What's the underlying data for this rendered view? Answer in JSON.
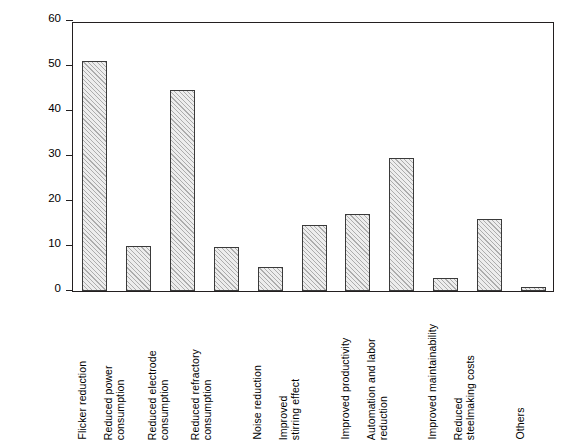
{
  "chart_data": {
    "type": "bar",
    "title": "",
    "subtitle": "",
    "xlabel": "",
    "ylabel": "Evaluation",
    "ylim": [
      0,
      60
    ],
    "yticks": [
      0,
      10,
      20,
      30,
      40,
      50,
      60
    ],
    "ytick_labels": [
      "0",
      "10",
      "20",
      "30",
      "40",
      "50",
      "60"
    ],
    "grid": false,
    "legend": null,
    "legend_position": "none",
    "bar_fill_color": "#ededed",
    "bar_edge_color": "#3a3a3a",
    "bar_hatch": "diagonal-lines",
    "frame_color": "#231f20",
    "categories": [
      "Flicker reduction",
      "Reduced power consumption",
      "Reduced electrode consumption",
      "Reduced refractory consumption",
      "Noise reduction",
      "Improved stirring effect",
      "Improved productivity",
      "Automation and labor reduction",
      "Improved maintainability",
      "Reduced steelmaking costs",
      "Others"
    ],
    "category_lines": [
      [
        "Flicker reduction"
      ],
      [
        "Reduced power",
        "consumption"
      ],
      [
        "Reduced electrode",
        "consumption"
      ],
      [
        "Reduced refractory",
        "consumption"
      ],
      [
        "Noise reduction"
      ],
      [
        "Improved",
        "stirring effect"
      ],
      [
        "Improved productivity"
      ],
      [
        "Automation and labor",
        "reduction"
      ],
      [
        "Improved maintainability"
      ],
      [
        "Reduced",
        "steelmaking costs"
      ],
      [
        "Others"
      ]
    ],
    "values": [
      51.1,
      10.0,
      44.7,
      9.8,
      5.3,
      14.7,
      17.2,
      29.6,
      2.8,
      15.9,
      0.8
    ]
  }
}
